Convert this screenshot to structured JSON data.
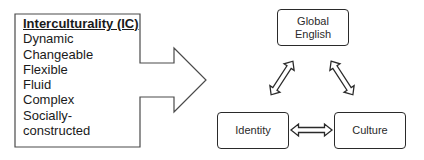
{
  "diagram": {
    "interculturality_box": {
      "title": "Interculturality (IC)",
      "items": [
        "Dynamic",
        "Changeable",
        "Flexible",
        "Fluid",
        "Complex",
        "Socially-",
        "constructed"
      ]
    },
    "nodes": {
      "global_english": "Global\nEnglish",
      "identity": "Identity",
      "culture": "Culture"
    },
    "connectors": [
      {
        "from": "Identity",
        "to": "Global English",
        "type": "bidirectional-arrow"
      },
      {
        "from": "Global English",
        "to": "Culture",
        "type": "bidirectional-arrow"
      },
      {
        "from": "Identity",
        "to": "Culture",
        "type": "bidirectional-arrow"
      }
    ],
    "colors": {
      "stroke": "#2a2a2a",
      "text": "#1a1a1a",
      "background": "#ffffff"
    }
  }
}
